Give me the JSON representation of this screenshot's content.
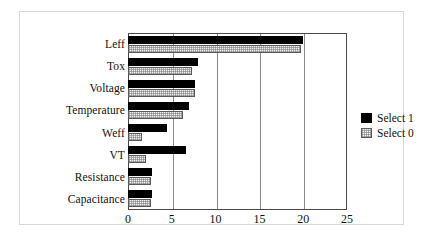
{
  "chart_data": {
    "type": "bar",
    "orientation": "horizontal",
    "title": "",
    "xlabel": "",
    "ylabel": "",
    "xlim": [
      0,
      25
    ],
    "xticks": [
      0,
      5,
      10,
      15,
      20,
      25
    ],
    "grid": true,
    "legend_position": "right",
    "categories": [
      "Leff",
      "Tox",
      "Voltage",
      "Temperature",
      "Weff",
      "VT",
      "Resistance",
      "Capacitance"
    ],
    "series": [
      {
        "name": "Select 1",
        "color": "#000000",
        "values": [
          20.0,
          8.0,
          7.7,
          7.0,
          4.4,
          6.6,
          2.7,
          2.7
        ]
      },
      {
        "name": "Select 0",
        "color": "#efefef",
        "values": [
          19.7,
          7.3,
          7.7,
          6.3,
          1.6,
          2.0,
          2.6,
          2.6
        ]
      }
    ]
  },
  "legend": {
    "items": [
      {
        "label": "Select 1",
        "swatch": "black-filled-swatch"
      },
      {
        "label": "Select 0",
        "swatch": "light-hatched-swatch"
      }
    ]
  }
}
